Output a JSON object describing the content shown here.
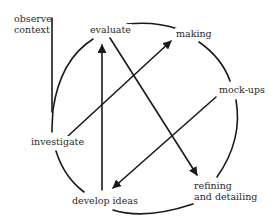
{
  "diagram": {
    "type": "design-process-cycle",
    "stroke_color": "#1a1a1a",
    "text_color": "#2a2a2a",
    "nodes": [
      {
        "id": "observe",
        "label_line1": "observe",
        "label_line2": "context"
      },
      {
        "id": "evaluate",
        "label": "evaluate"
      },
      {
        "id": "making",
        "label": "making"
      },
      {
        "id": "mockups",
        "label": "mock-ups"
      },
      {
        "id": "investigate",
        "label": "investigate"
      },
      {
        "id": "develop",
        "label": "develop ideas"
      },
      {
        "id": "refining",
        "label_line1": "refining",
        "label_line2": "and detailing"
      }
    ],
    "arrows": [
      {
        "from": "develop ideas",
        "to": "evaluate"
      },
      {
        "from": "investigate",
        "to": "making"
      },
      {
        "from": "evaluate",
        "to": "refining and detailing"
      },
      {
        "from": "mock-ups",
        "to": "develop ideas"
      }
    ]
  }
}
